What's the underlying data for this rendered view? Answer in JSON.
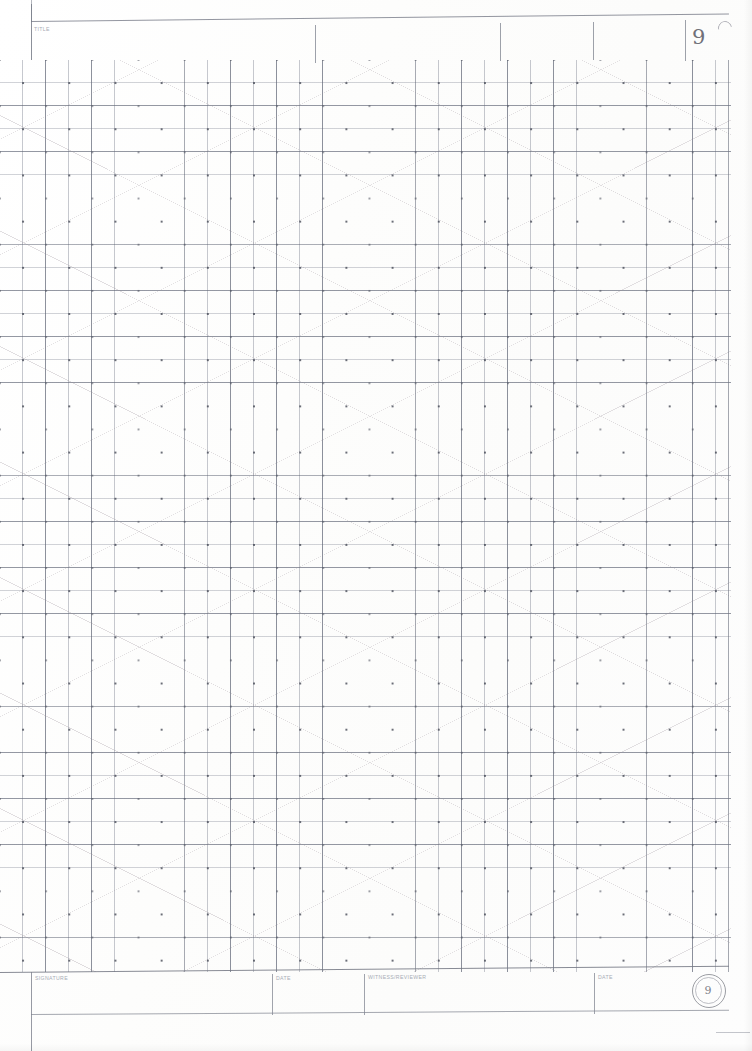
{
  "document": {
    "kind": "laboratory-notebook-page",
    "page_number": "9",
    "page_number_stamp": "9",
    "paper": {
      "grid_type": "square-grid-with-diagonals-and-dots",
      "grid_color": "#787d8c",
      "diagonal_color": "#968c96",
      "dot_color": "#464a56",
      "background": "#ffffff"
    }
  },
  "header": {
    "title_label": "TITLE",
    "title_value": "",
    "page_number": "9",
    "fields": [
      {
        "label": "TITLE",
        "value": ""
      },
      {
        "label": "",
        "value": ""
      },
      {
        "label": "",
        "value": ""
      },
      {
        "label": "",
        "value": ""
      },
      {
        "label": "",
        "value": "9"
      }
    ]
  },
  "body": {
    "content": "",
    "notes": ""
  },
  "footer": {
    "fields": [
      {
        "label": "SIGNATURE",
        "value": ""
      },
      {
        "label": "DATE",
        "value": ""
      },
      {
        "label": "WITNESS/REVIEWER",
        "value": ""
      },
      {
        "label": "DATE",
        "value": ""
      }
    ],
    "signature_label": "SIGNATURE",
    "date_label_1": "DATE",
    "witness_label": "WITNESS/REVIEWER",
    "date_label_2": "DATE",
    "page_stamp": "9"
  }
}
